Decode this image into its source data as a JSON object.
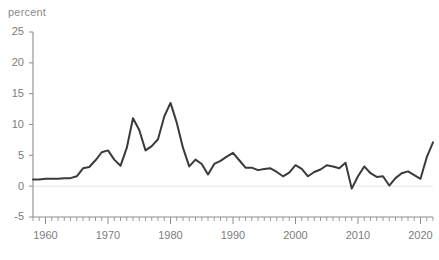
{
  "chart_data": {
    "type": "line",
    "title": "",
    "subtitle": "",
    "xlabel": "",
    "ylabel": "percent",
    "ylim": [
      -5,
      25
    ],
    "xlim": [
      1958,
      2022
    ],
    "yticks": [
      -5,
      0,
      5,
      10,
      15,
      20,
      25
    ],
    "ytick_labels": [
      "-5",
      "0",
      "5",
      "10",
      "15",
      "20",
      "25"
    ],
    "xticks": [
      1960,
      1970,
      1980,
      1990,
      2000,
      2010,
      2020
    ],
    "xtick_labels": [
      "1960",
      "1970",
      "1980",
      "1990",
      "2000",
      "2010",
      "2020"
    ],
    "minor_xtick_step": 1,
    "grid": "zero-line-only",
    "legend": "none",
    "line_color": "#3a3a3a",
    "axis_color": "#8d8d8d",
    "label_color": "#7c7c7c",
    "series": [
      {
        "name": "percent",
        "x": [
          1958,
          1959,
          1960,
          1961,
          1962,
          1963,
          1964,
          1965,
          1966,
          1967,
          1968,
          1969,
          1970,
          1971,
          1972,
          1973,
          1974,
          1975,
          1976,
          1977,
          1978,
          1979,
          1980,
          1981,
          1982,
          1983,
          1984,
          1985,
          1986,
          1987,
          1988,
          1989,
          1990,
          1991,
          1992,
          1993,
          1994,
          1995,
          1996,
          1997,
          1998,
          1999,
          2000,
          2001,
          2002,
          2003,
          2004,
          2005,
          2006,
          2007,
          2008,
          2009,
          2010,
          2011,
          2012,
          2013,
          2014,
          2015,
          2016,
          2017,
          2018,
          2019,
          2020,
          2021,
          2022
        ],
        "values": [
          1.1,
          1.1,
          1.2,
          1.2,
          1.2,
          1.3,
          1.3,
          1.6,
          2.9,
          3.1,
          4.2,
          5.5,
          5.8,
          4.3,
          3.3,
          6.2,
          11.0,
          9.1,
          5.8,
          6.5,
          7.6,
          11.3,
          13.5,
          10.3,
          6.2,
          3.2,
          4.3,
          3.6,
          1.9,
          3.6,
          4.1,
          4.8,
          5.4,
          4.2,
          3.0,
          3.0,
          2.6,
          2.8,
          2.9,
          2.3,
          1.6,
          2.2,
          3.4,
          2.8,
          1.6,
          2.3,
          2.7,
          3.4,
          3.2,
          2.9,
          3.8,
          -0.4,
          1.6,
          3.2,
          2.1,
          1.5,
          1.6,
          0.1,
          1.3,
          2.1,
          2.4,
          1.8,
          1.2,
          4.7,
          7.1
        ]
      }
    ]
  }
}
